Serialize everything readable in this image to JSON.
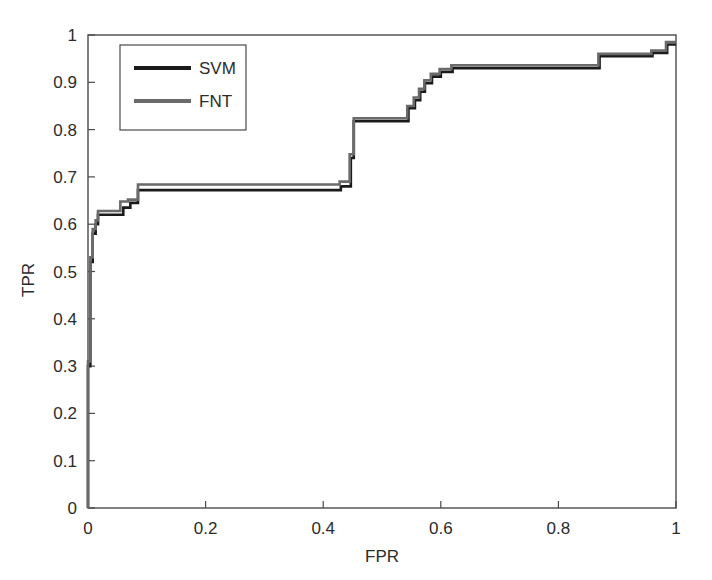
{
  "chart_data": {
    "type": "line",
    "title": "",
    "xlabel": "FPR",
    "ylabel": "TPR",
    "xlim": [
      0,
      1
    ],
    "ylim": [
      0,
      1
    ],
    "xticks": [
      "0",
      "0.2",
      "0.4",
      "0.6",
      "0.8",
      "1"
    ],
    "xtick_values": [
      0,
      0.2,
      0.4,
      0.6,
      0.8,
      1
    ],
    "yticks": [
      "0",
      "0.1",
      "0.2",
      "0.3",
      "0.4",
      "0.5",
      "0.6",
      "0.7",
      "0.8",
      "0.9",
      "1"
    ],
    "ytick_values": [
      0,
      0.1,
      0.2,
      0.3,
      0.4,
      0.5,
      0.6,
      0.7,
      0.8,
      0.9,
      1
    ],
    "grid": false,
    "legend_position": "upper-left",
    "series": [
      {
        "name": "SVM",
        "color": "#1a1a1a",
        "x": [
          0.0,
          0.0,
          0.004,
          0.004,
          0.008,
          0.008,
          0.013,
          0.013,
          0.017,
          0.017,
          0.06,
          0.06,
          0.072,
          0.072,
          0.085,
          0.085,
          0.43,
          0.43,
          0.447,
          0.447,
          0.452,
          0.452,
          0.545,
          0.545,
          0.556,
          0.556,
          0.565,
          0.565,
          0.573,
          0.573,
          0.585,
          0.585,
          0.6,
          0.6,
          0.62,
          0.62,
          0.87,
          0.87,
          0.96,
          0.96,
          0.985,
          0.985,
          1.0
        ],
        "y": [
          0.0,
          0.3,
          0.3,
          0.52,
          0.52,
          0.58,
          0.58,
          0.6,
          0.6,
          0.62,
          0.62,
          0.635,
          0.635,
          0.645,
          0.645,
          0.672,
          0.672,
          0.68,
          0.68,
          0.74,
          0.74,
          0.818,
          0.818,
          0.845,
          0.845,
          0.862,
          0.862,
          0.88,
          0.88,
          0.898,
          0.898,
          0.912,
          0.912,
          0.922,
          0.922,
          0.93,
          0.93,
          0.955,
          0.955,
          0.962,
          0.962,
          0.98,
          0.98
        ]
      },
      {
        "name": "FNT",
        "color": "#6a6a6a",
        "x": [
          0.0,
          0.0,
          0.004,
          0.004,
          0.008,
          0.008,
          0.013,
          0.013,
          0.017,
          0.017,
          0.055,
          0.055,
          0.068,
          0.068,
          0.085,
          0.085,
          0.428,
          0.428,
          0.445,
          0.445,
          0.452,
          0.452,
          0.543,
          0.543,
          0.554,
          0.554,
          0.563,
          0.563,
          0.572,
          0.572,
          0.583,
          0.583,
          0.598,
          0.598,
          0.618,
          0.618,
          0.868,
          0.868,
          0.958,
          0.958,
          0.983,
          0.983,
          1.0
        ],
        "y": [
          0.0,
          0.31,
          0.31,
          0.53,
          0.53,
          0.59,
          0.59,
          0.608,
          0.608,
          0.628,
          0.628,
          0.648,
          0.648,
          0.652,
          0.652,
          0.684,
          0.684,
          0.69,
          0.69,
          0.748,
          0.748,
          0.824,
          0.824,
          0.85,
          0.85,
          0.868,
          0.868,
          0.886,
          0.886,
          0.904,
          0.904,
          0.918,
          0.918,
          0.928,
          0.928,
          0.936,
          0.936,
          0.96,
          0.96,
          0.967,
          0.967,
          0.985,
          0.985
        ]
      }
    ]
  },
  "legend": {
    "items": [
      {
        "label": "SVM",
        "color": "#1a1a1a"
      },
      {
        "label": "FNT",
        "color": "#6a6a6a"
      }
    ]
  },
  "axes": {
    "x_title": "FPR",
    "y_title": "TPR"
  },
  "style": {
    "background": "#ffffff",
    "axis_color": "#4a4a4a",
    "text_color": "#2b2b2b"
  }
}
